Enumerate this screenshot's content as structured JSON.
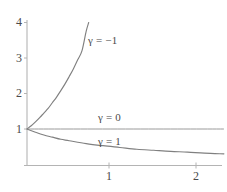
{
  "chart_data": {
    "type": "line",
    "title": "",
    "subtitle": "",
    "xlabel": "",
    "ylabel": "",
    "xlim": [
      -0.02,
      2.35
    ],
    "ylim": [
      0,
      4.35
    ],
    "grid": false,
    "legend_position": "inline-annotations",
    "x_ticks": [
      {
        "value": 1,
        "label": "1"
      },
      {
        "value": 2,
        "label": "2"
      }
    ],
    "y_ticks": [
      {
        "value": 1,
        "label": "1"
      },
      {
        "value": 2,
        "label": "2"
      },
      {
        "value": 3,
        "label": "3"
      },
      {
        "value": 4,
        "label": "4"
      }
    ],
    "series": [
      {
        "name": "γ = −1",
        "annotation": "γ = −1",
        "color": "#808080",
        "formula": "(1 + x)^1",
        "note": "rising convex curve from (0,1) to about (0.73,4)",
        "x": [
          0,
          0.05,
          0.1,
          0.15,
          0.2,
          0.25,
          0.3,
          0.35,
          0.4,
          0.45,
          0.5,
          0.55,
          0.6,
          0.65,
          0.7,
          0.73
        ],
        "y": [
          1.0,
          1.09,
          1.2,
          1.32,
          1.45,
          1.58,
          1.74,
          1.9,
          2.08,
          2.27,
          2.48,
          2.7,
          2.95,
          3.2,
          3.75,
          4.0
        ]
      },
      {
        "name": "γ = 0",
        "annotation": "γ = 0",
        "color": "#9a9a9a",
        "formula": "1",
        "note": "horizontal line at y = 1",
        "x": [
          0,
          2.33
        ],
        "y": [
          1.0,
          1.0
        ]
      },
      {
        "name": "γ = 1",
        "annotation": "γ = 1",
        "color": "#808080",
        "formula": "1 / (1 + x)",
        "note": "decaying hyperbola from (0,1) to about (2.33,0.3)",
        "x": [
          0,
          0.1,
          0.2,
          0.3,
          0.4,
          0.5,
          0.7,
          0.9,
          1.1,
          1.3,
          1.5,
          1.7,
          1.9,
          2.1,
          2.33
        ],
        "y": [
          1.0,
          0.91,
          0.83,
          0.77,
          0.71,
          0.67,
          0.59,
          0.53,
          0.48,
          0.43,
          0.4,
          0.37,
          0.35,
          0.32,
          0.3
        ]
      }
    ],
    "axes": {
      "x_axis_color": "#b4b4b4",
      "y_axis_color": "#b4b4b4",
      "tick_color": "#b4b4b4"
    }
  },
  "annotations": {
    "gamma_neg1": "γ = −1",
    "gamma_0": "γ = 0",
    "gamma_1": "γ = 1"
  },
  "ticks": {
    "y4": "4",
    "y3": "3",
    "y2": "2",
    "y1": "1",
    "x1": "1",
    "x2": "2"
  }
}
